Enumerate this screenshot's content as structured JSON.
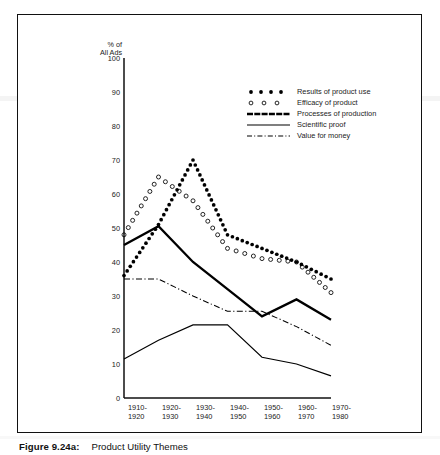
{
  "figure": {
    "caption_number": "Figure 9.24a:",
    "caption_text": "Product Utility Themes"
  },
  "chart_data": {
    "type": "line",
    "title": "",
    "subtitle": "",
    "xlabel": "",
    "ylabel": "% of All Ads",
    "ylabel_lines": [
      "% of",
      "All Ads"
    ],
    "ylim": [
      0,
      100
    ],
    "yticks": [
      0,
      10,
      20,
      30,
      40,
      50,
      60,
      70,
      80,
      90,
      100
    ],
    "ytick_labels": [
      "0",
      "10",
      "20",
      "30",
      "40",
      "50",
      "60",
      "70",
      "80",
      "90",
      "100"
    ],
    "grid": false,
    "legend_position": "upper-right-inside",
    "categories": [
      "1910-1920",
      "1920-1930",
      "1930-1940",
      "1940-1950",
      "1950-1960",
      "1960-1970",
      "1970-1980"
    ],
    "category_lines": [
      [
        "1910-",
        "1920"
      ],
      [
        "1920-",
        "1930"
      ],
      [
        "1930-",
        "1940"
      ],
      [
        "1940-",
        "1950"
      ],
      [
        "1950-",
        "1960"
      ],
      [
        "1960-",
        "1970"
      ],
      [
        "1970-",
        "1980"
      ]
    ],
    "series": [
      {
        "name": "Results of product use",
        "style": "dotted-filled-circles",
        "color": "#000000",
        "values": [
          36,
          51,
          70,
          48,
          44,
          40,
          35
        ]
      },
      {
        "name": "Efficacy of product",
        "style": "dotted-open-circles",
        "color": "#000000",
        "values": [
          48,
          65,
          58,
          44,
          41,
          40,
          31
        ]
      },
      {
        "name": "Processes of production",
        "style": "thick-solid",
        "color": "#000000",
        "values": [
          45,
          50.5,
          40,
          32,
          24,
          29,
          23
        ]
      },
      {
        "name": "Scientific proof",
        "style": "thin-solid",
        "color": "#000000",
        "values": [
          11.5,
          17,
          21.5,
          21.5,
          12,
          10,
          6.5
        ]
      },
      {
        "name": "Value for money",
        "style": "dash-dot",
        "color": "#000000",
        "values": [
          35,
          35,
          30,
          25.5,
          25.5,
          21,
          15.5
        ]
      }
    ]
  },
  "legend": {
    "items": [
      {
        "label": "Results of product use",
        "key": "dotted-filled-circles"
      },
      {
        "label": "Efficacy of product",
        "key": "dotted-open-circles"
      },
      {
        "label": "Processes of production",
        "key": "thick-solid"
      },
      {
        "label": "Scientific proof",
        "key": "thin-solid"
      },
      {
        "label": "Value for money",
        "key": "dash-dot"
      }
    ]
  }
}
